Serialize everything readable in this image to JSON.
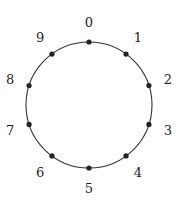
{
  "diagram": {
    "type": "circular-node-ring",
    "center": [
      89,
      105
    ],
    "radius": 63,
    "label_radius": 83,
    "stroke_color": "#333333",
    "node_color": "#222222",
    "node_radius": 2.6,
    "nodes": [
      {
        "label": "0"
      },
      {
        "label": "1"
      },
      {
        "label": "2"
      },
      {
        "label": "3"
      },
      {
        "label": "4"
      },
      {
        "label": "5"
      },
      {
        "label": "6"
      },
      {
        "label": "7"
      },
      {
        "label": "8"
      },
      {
        "label": "9"
      }
    ]
  }
}
